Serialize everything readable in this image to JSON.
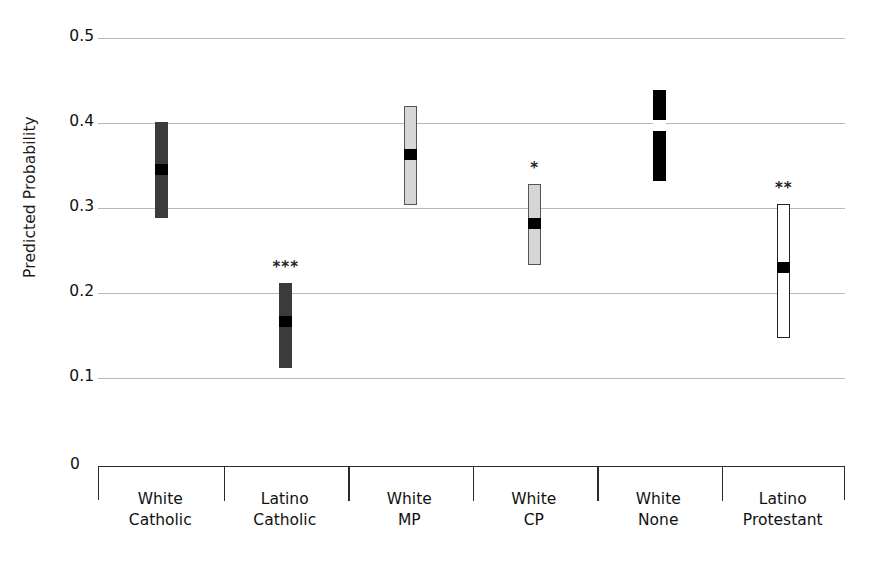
{
  "chart_data": {
    "type": "bar",
    "title": "",
    "subtitle": "",
    "xlabel": "",
    "ylabel": "Predicted Probability",
    "ylim": [
      0.0,
      0.5
    ],
    "yticks": [
      "0.5",
      "0.4",
      "0.3",
      "0.2",
      "0.1",
      "0"
    ],
    "ytick_values": [
      0.5,
      0.4,
      0.3,
      0.2,
      0.1,
      0.0
    ],
    "grid": true,
    "legend": "none",
    "interval_note": "Vertical bars show confidence intervals; the inset square marks the point estimate.",
    "categories": [
      "White Catholic",
      "Latino Catholic",
      "White MP",
      "White CP",
      "White None",
      "Latino Protestant"
    ],
    "category_lines": [
      [
        "White",
        "Catholic"
      ],
      [
        "Latino",
        "Catholic"
      ],
      [
        "White",
        "MP"
      ],
      [
        "White",
        "CP"
      ],
      [
        "White",
        "None"
      ],
      [
        "Latino",
        "Protestant"
      ]
    ],
    "series": [
      {
        "name": "Predicted Probability",
        "points": [
          {
            "category": "White Catholic",
            "estimate": 0.345,
            "ci_low": 0.288,
            "ci_high": 0.401,
            "significance": "",
            "fill": "#3b3b3b",
            "marker_color": "#000000",
            "stroke": "none"
          },
          {
            "category": "Latino Catholic",
            "estimate": 0.166,
            "ci_low": 0.112,
            "ci_high": 0.212,
            "significance": "***",
            "fill": "#3b3b3b",
            "marker_color": "#000000",
            "stroke": "none"
          },
          {
            "category": "White MP",
            "estimate": 0.363,
            "ci_low": 0.303,
            "ci_high": 0.42,
            "significance": "",
            "fill": "#d6d6d6",
            "marker_color": "#000000",
            "stroke": "#555555"
          },
          {
            "category": "White CP",
            "estimate": 0.282,
            "ci_low": 0.233,
            "ci_high": 0.328,
            "significance": "*",
            "fill": "#d6d6d6",
            "marker_color": "#000000",
            "stroke": "#555555"
          },
          {
            "category": "White None",
            "estimate": 0.397,
            "ci_low": 0.332,
            "ci_high": 0.439,
            "significance": "",
            "fill": "#000000",
            "marker_color": "#ffffff",
            "stroke": "none"
          },
          {
            "category": "Latino Protestant",
            "estimate": 0.23,
            "ci_low": 0.147,
            "ci_high": 0.305,
            "significance": "**",
            "fill": "#ffffff",
            "marker_color": "#000000",
            "stroke": "#222222"
          }
        ]
      }
    ],
    "colors": {
      "gridline": "#b9b9b9",
      "axis": "#2a2a2a",
      "text": "#111111"
    }
  }
}
